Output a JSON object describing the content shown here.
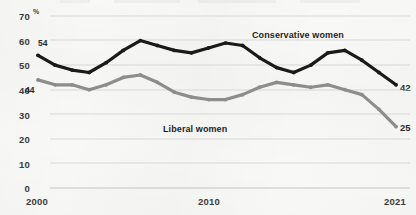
{
  "chart_data": {
    "type": "line",
    "title": "",
    "xlabel": "",
    "ylabel": "%",
    "ylim": [
      0,
      70
    ],
    "yticks": [
      0,
      10,
      20,
      30,
      40,
      50,
      60,
      70
    ],
    "unit_symbol": "%",
    "grid": true,
    "legend_position": "inline-annotation",
    "xticks": [
      "2000",
      "2010",
      "2021"
    ],
    "x": [
      2000,
      2001,
      2002,
      2003,
      2004,
      2005,
      2006,
      2007,
      2008,
      2009,
      2010,
      2011,
      2012,
      2013,
      2014,
      2015,
      2016,
      2017,
      2018,
      2019,
      2020,
      2021
    ],
    "series": [
      {
        "name": "Conservative women",
        "color": "#1a1a1a",
        "start_value": 54,
        "end_value": 42,
        "values": [
          54,
          50,
          48,
          47,
          51,
          56,
          60,
          58,
          56,
          55,
          57,
          59,
          58,
          53,
          49,
          47,
          50,
          55,
          56,
          52,
          47,
          42
        ]
      },
      {
        "name": "Liberal women",
        "color": "#8d8d8d",
        "start_value": 44,
        "end_value": 25,
        "values": [
          44,
          42,
          42,
          40,
          42,
          45,
          46,
          43,
          39,
          37,
          36,
          36,
          38,
          41,
          43,
          42,
          41,
          42,
          40,
          38,
          32,
          25
        ]
      }
    ],
    "annotations": [
      {
        "text": "Conservative women",
        "series": "Conservative women"
      },
      {
        "text": "Liberal women",
        "series": "Liberal women"
      },
      {
        "text": "54",
        "kind": "start-value",
        "series": "Conservative women"
      },
      {
        "text": "44",
        "kind": "start-value",
        "series": "Liberal women"
      },
      {
        "text": "42",
        "kind": "end-value",
        "series": "Conservative women"
      },
      {
        "text": "25",
        "kind": "end-value",
        "series": "Liberal women"
      }
    ]
  },
  "axis": {
    "y_labels": [
      "70",
      "60",
      "50",
      "40",
      "30",
      "20",
      "10",
      "0"
    ],
    "percent_symbol": "%",
    "x_labels": [
      "2000",
      "2010",
      "2021"
    ]
  },
  "labels": {
    "conservative": "Conservative women",
    "liberal": "Liberal women",
    "conservative_start": "54",
    "liberal_start": "44",
    "conservative_end": "42",
    "liberal_end": "25"
  }
}
